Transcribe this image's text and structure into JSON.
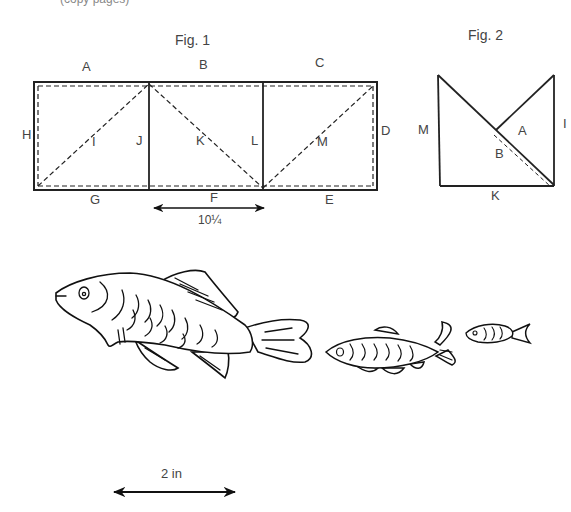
{
  "header_fragment": "(copy pages)",
  "fig1": {
    "title": "Fig. 1",
    "labels": {
      "A": "A",
      "B": "B",
      "C": "C",
      "D": "D",
      "E": "E",
      "F": "F",
      "G": "G",
      "H": "H",
      "I": "I",
      "J": "J",
      "K": "K",
      "L": "L",
      "M": "M"
    },
    "dimension": "10¼"
  },
  "fig2": {
    "title": "Fig. 2",
    "labels": {
      "M": "M",
      "A": "A",
      "B": "B",
      "I": "I",
      "K": "K"
    }
  },
  "fish": [
    {
      "name": "large-fish"
    },
    {
      "name": "medium-fish"
    },
    {
      "name": "small-fish"
    }
  ],
  "scale_bar": {
    "label": "2 in"
  }
}
